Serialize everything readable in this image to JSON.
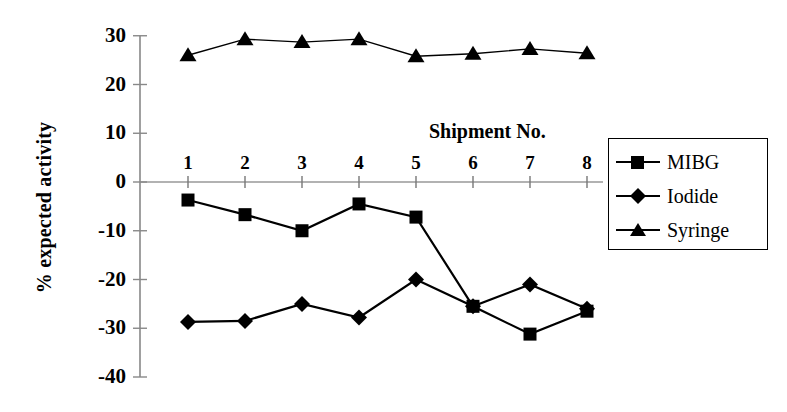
{
  "chart_data": {
    "type": "line",
    "title": "",
    "xlabel": "Shipment No.",
    "ylabel": "% expected activity",
    "categories": [
      "1",
      "2",
      "3",
      "4",
      "5",
      "6",
      "7",
      "8"
    ],
    "x": [
      1,
      2,
      3,
      4,
      5,
      6,
      7,
      8
    ],
    "xlim": [
      0.5,
      8.5
    ],
    "ylim": [
      -40,
      30
    ],
    "yticks": [
      30,
      20,
      10,
      0,
      -10,
      -20,
      -30,
      -40
    ],
    "ytick_labels": [
      "30",
      "20",
      "10",
      "0",
      "-10",
      "-20",
      "-30",
      "-40"
    ],
    "xticks": [
      1,
      2,
      3,
      4,
      5,
      6,
      7,
      8
    ],
    "xtick_labels": [
      "1",
      "2",
      "3",
      "4",
      "5",
      "6",
      "7",
      "8"
    ],
    "grid": false,
    "legend_position": "right",
    "series": [
      {
        "name": "MIBG",
        "marker": "square",
        "color": "#000000",
        "values": [
          -3.7,
          -6.7,
          -10.0,
          -4.5,
          -7.2,
          -25.5,
          -31.2,
          -26.5
        ]
      },
      {
        "name": "Iodide",
        "marker": "diamond",
        "color": "#000000",
        "values": [
          -28.7,
          -28.5,
          -25.0,
          -27.8,
          -20.0,
          -25.5,
          -21.0,
          -26.0
        ]
      },
      {
        "name": "Syringe",
        "marker": "triangle",
        "color": "#000000",
        "values": [
          26.0,
          29.3,
          28.7,
          29.3,
          25.8,
          26.3,
          27.3,
          26.4
        ]
      }
    ]
  },
  "axis": {
    "y_title": "% expected activity",
    "x_caption": "Shipment No."
  },
  "legend": {
    "entries": [
      {
        "label": "MIBG",
        "marker": "square"
      },
      {
        "label": "Iodide",
        "marker": "diamond"
      },
      {
        "label": "Syringe",
        "marker": "triangle"
      }
    ]
  }
}
